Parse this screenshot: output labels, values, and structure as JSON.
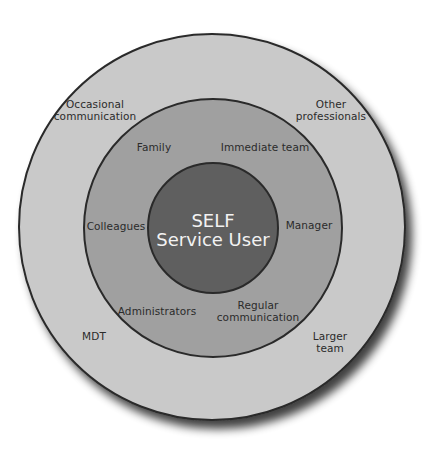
{
  "diagram": {
    "type": "concentric-circles",
    "colors": {
      "background": "#ffffff",
      "outer_ring": "#c9c9c9",
      "middle_ring": "#a0a0a0",
      "inner_circle": "#5f5f5f",
      "stroke": "#2a2a2a",
      "center_text": "#f2f2f2",
      "label_text": "#2b2b2b"
    },
    "center": {
      "line1": "SELF",
      "line2": "Service User"
    },
    "middle_ring": {
      "labels": [
        "Family",
        "Immediate team",
        "Colleagues",
        "Manager",
        "Administrators",
        "Regular",
        "communication"
      ]
    },
    "outer_ring": {
      "labels": [
        "Occasional",
        "communication",
        "Other",
        "professionals",
        "MDT",
        "Larger",
        "team"
      ]
    }
  }
}
